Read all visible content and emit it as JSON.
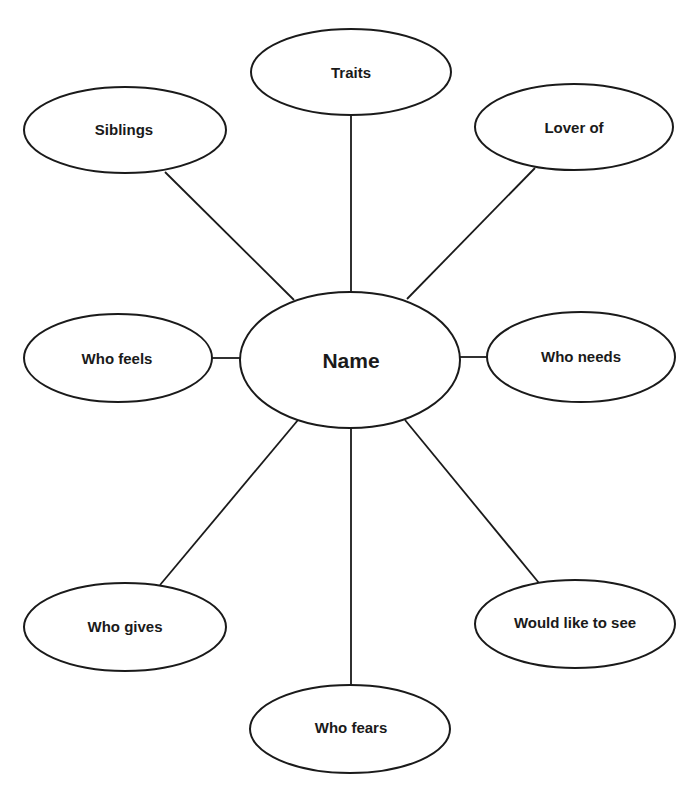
{
  "diagram": {
    "type": "character-web",
    "center": {
      "id": "name",
      "label": "Name"
    },
    "nodes": [
      {
        "id": "traits",
        "label": "Traits"
      },
      {
        "id": "siblings",
        "label": "Siblings"
      },
      {
        "id": "lover-of",
        "label": "Lover of"
      },
      {
        "id": "who-feels",
        "label": "Who feels"
      },
      {
        "id": "who-needs",
        "label": "Who needs"
      },
      {
        "id": "who-gives",
        "label": "Who gives"
      },
      {
        "id": "would-like-to-see",
        "label": "Would like to see"
      },
      {
        "id": "who-fears",
        "label": "Who fears"
      }
    ],
    "edges": [
      {
        "from": "name",
        "to": "traits"
      },
      {
        "from": "name",
        "to": "siblings"
      },
      {
        "from": "name",
        "to": "lover-of"
      },
      {
        "from": "name",
        "to": "who-feels"
      },
      {
        "from": "name",
        "to": "who-needs"
      },
      {
        "from": "name",
        "to": "who-gives"
      },
      {
        "from": "name",
        "to": "would-like-to-see"
      },
      {
        "from": "name",
        "to": "who-fears"
      }
    ],
    "colors": {
      "stroke": "#1a1a1a",
      "fill": "#ffffff",
      "text": "#1a1a1a"
    }
  }
}
